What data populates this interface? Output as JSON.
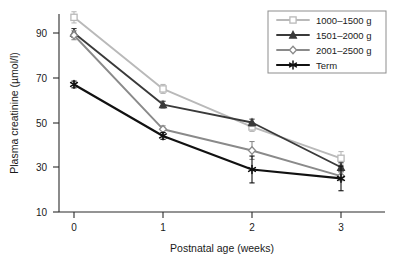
{
  "chart_data": {
    "type": "line",
    "title": "",
    "xlabel": "Postnatal age (weeks)",
    "ylabel": "Plasma creatinine (µmol/l)",
    "x": [
      0,
      1,
      2,
      3
    ],
    "xtick_labels": [
      "0",
      "1",
      "2",
      "3"
    ],
    "ytick_labels": [
      "10",
      "30",
      "50",
      "70",
      "90"
    ],
    "yticks": [
      10,
      30,
      50,
      70,
      90
    ],
    "xlim": [
      -0.25,
      3.4
    ],
    "ylim": [
      8,
      102
    ],
    "grid": false,
    "legend_position": "top-right",
    "series": [
      {
        "name": "1000–1500 g",
        "color": "#b9b9b9",
        "marker": "square",
        "values": [
          97,
          65,
          48,
          34
        ],
        "errors": [
          2.5,
          2.0,
          2.0,
          3.0
        ]
      },
      {
        "name": "1501–2000 g",
        "color": "#3a3a3a",
        "marker": "triangle",
        "values": [
          90,
          58,
          50,
          30
        ],
        "errors": [
          2.0,
          1.5,
          1.5,
          2.0
        ]
      },
      {
        "name": "2001–2500 g",
        "color": "#8a8a8a",
        "marker": "diamond",
        "values": [
          89,
          47,
          37.5,
          26
        ],
        "errors": [
          2.0,
          1.5,
          4.0,
          2.0
        ]
      },
      {
        "name": "Term",
        "color": "#111111",
        "marker": "star",
        "values": [
          67,
          44,
          29,
          25
        ],
        "errors": [
          1.5,
          1.5,
          6.0,
          5.5
        ]
      }
    ]
  },
  "legend": {
    "entries": [
      {
        "label": "1000–1500 g"
      },
      {
        "label": "1501–2000 g"
      },
      {
        "label": "2001–2500 g"
      },
      {
        "label": "Term"
      }
    ]
  },
  "axes": {
    "x_title": "Postnatal age (weeks)",
    "y_title": "Plasma creatinine (µmol/l)",
    "x_ticks": [
      "0",
      "1",
      "2",
      "3"
    ],
    "y_ticks": [
      "90",
      "70",
      "50",
      "30",
      "10"
    ]
  }
}
